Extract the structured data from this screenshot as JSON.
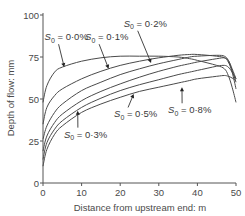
{
  "chart_data": {
    "type": "line",
    "title": "",
    "xlabel": "Distance from upstream end: m",
    "ylabel": "Depth of flow: mm",
    "xlim": [
      0,
      50
    ],
    "ylim": [
      0,
      100
    ],
    "xticks": [
      0,
      10,
      20,
      30,
      40,
      50
    ],
    "yticks": [
      0,
      25,
      50,
      75,
      100
    ],
    "grid": false,
    "legend": "none (inline arrow annotations)",
    "x": [
      0,
      1,
      3,
      5,
      10,
      15,
      20,
      25,
      30,
      35,
      38,
      40,
      45,
      47,
      48,
      49,
      50
    ],
    "series": [
      {
        "name": "S0 = 0·0%",
        "values": [
          48,
          58,
          66,
          69,
          72.5,
          74.5,
          75.5,
          75.5,
          75.5,
          75,
          74,
          73,
          70,
          68,
          64,
          57,
          48
        ]
      },
      {
        "name": "S0 = 0·1%",
        "values": [
          35,
          45,
          52,
          56,
          62,
          66.5,
          70,
          72.5,
          74.5,
          76,
          76.5,
          76.5,
          75.5,
          74.5,
          72,
          66,
          56
        ]
      },
      {
        "name": "S0 = 0·2%",
        "values": [
          26,
          34,
          42,
          47,
          55,
          60,
          64.5,
          68,
          71,
          73.5,
          75,
          75.5,
          76,
          75.5,
          73,
          67,
          60
        ]
      },
      {
        "name": "S0 = 0·3%",
        "values": [
          19,
          28,
          36,
          41,
          49,
          54.5,
          59,
          63,
          66.5,
          69.5,
          71,
          72,
          74,
          74.5,
          73,
          68,
          62
        ]
      },
      {
        "name": "S0 = 0·5%",
        "values": [
          14,
          24,
          32,
          37,
          45,
          50.5,
          55,
          58.5,
          61.5,
          64.5,
          66,
          67,
          69.5,
          70,
          69,
          66,
          62
        ]
      },
      {
        "name": "S0 = 0·8%",
        "values": [
          10,
          20,
          29,
          34,
          42,
          47,
          51,
          54.5,
          57,
          59.5,
          61,
          62,
          63.5,
          64,
          63.5,
          62.5,
          61
        ]
      }
    ],
    "annotations": [
      {
        "text_sub": "0",
        "value": "0·0%",
        "arrow_to_x": 5.5,
        "arrow_to_y": 69,
        "label_x": 3,
        "label_y": 85
      },
      {
        "text_sub": "0",
        "value": "0·1%",
        "arrow_to_x": 17,
        "arrow_to_y": 68,
        "label_x": 13.5,
        "label_y": 85
      },
      {
        "text_sub": "0",
        "value": "0·2%",
        "arrow_to_x": 28,
        "arrow_to_y": 71.5,
        "label_x": 23.5,
        "label_y": 93
      },
      {
        "text_sub": "0",
        "value": "0·3%",
        "arrow_to_x": 9,
        "arrow_to_y": 43,
        "label_x": 8,
        "label_y": 27
      },
      {
        "text_sub": "0",
        "value": "0·5%",
        "arrow_to_x": 23.5,
        "arrow_to_y": 53,
        "label_x": 21,
        "label_y": 39
      },
      {
        "text_sub": "0",
        "value": "0·8%",
        "arrow_to_x": 36,
        "arrow_to_y": 57,
        "label_x": 35,
        "label_y": 41.5
      }
    ]
  },
  "labels": {
    "s_symbol": "S",
    "equals": " = "
  }
}
